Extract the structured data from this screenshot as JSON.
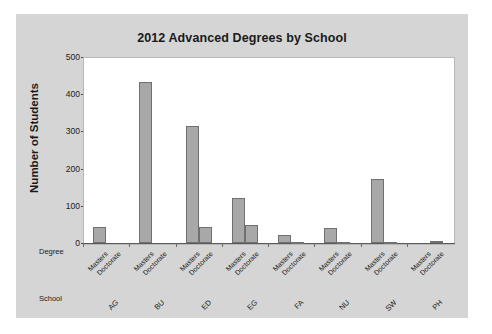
{
  "chart_data": {
    "type": "bar",
    "title": "2012 Advanced Degrees by School",
    "xlabel": "",
    "ylabel": "Number of Students",
    "ylim": [
      0,
      500
    ],
    "yticks": [
      0,
      100,
      200,
      300,
      400,
      500
    ],
    "grid": false,
    "legend": null,
    "axis_row_headers": {
      "degree": "Degree",
      "school": "School"
    },
    "degree_categories": [
      "Masters",
      "Doctorate"
    ],
    "categories": [
      "AG",
      "BU",
      "ED",
      "EG",
      "FA",
      "NU",
      "SW",
      "PH"
    ],
    "series": [
      {
        "name": "Masters",
        "values": [
          43,
          433,
          315,
          120,
          21,
          40,
          172,
          0
        ]
      },
      {
        "name": "Doctorate",
        "values": [
          0,
          0,
          44,
          48,
          3,
          4,
          2,
          5
        ]
      }
    ],
    "bars": [
      {
        "school": "AG",
        "degree": "Masters",
        "value": 43
      },
      {
        "school": "AG",
        "degree": "Doctorate",
        "value": 0
      },
      {
        "school": "BU",
        "degree": "Masters",
        "value": 433
      },
      {
        "school": "BU",
        "degree": "Doctorate",
        "value": 0
      },
      {
        "school": "ED",
        "degree": "Masters",
        "value": 315
      },
      {
        "school": "ED",
        "degree": "Doctorate",
        "value": 44
      },
      {
        "school": "EG",
        "degree": "Masters",
        "value": 120
      },
      {
        "school": "EG",
        "degree": "Doctorate",
        "value": 48
      },
      {
        "school": "FA",
        "degree": "Masters",
        "value": 21
      },
      {
        "school": "FA",
        "degree": "Doctorate",
        "value": 3
      },
      {
        "school": "NU",
        "degree": "Masters",
        "value": 40
      },
      {
        "school": "NU",
        "degree": "Doctorate",
        "value": 4
      },
      {
        "school": "SW",
        "degree": "Masters",
        "value": 172
      },
      {
        "school": "SW",
        "degree": "Doctorate",
        "value": 2
      },
      {
        "school": "PH",
        "degree": "Masters",
        "value": 0
      },
      {
        "school": "PH",
        "degree": "Doctorate",
        "value": 5
      }
    ],
    "colors": {
      "bar_fill": "#a8a8a8",
      "bar_edge": "#707070",
      "figure_background": "#d5d5d5",
      "plot_background": "#ffffff",
      "text": "#1a1a1a"
    }
  }
}
